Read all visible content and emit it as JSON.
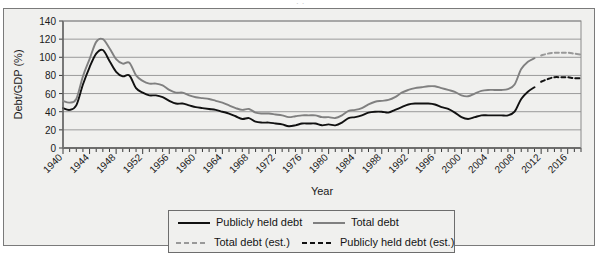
{
  "figure": {
    "clipped_caption": "· ·",
    "background_color": "#f0f0ee",
    "frame_color": "#7a7a7a"
  },
  "chart_data": {
    "type": "line",
    "title": "",
    "xlabel": "Year",
    "ylabel": "Debt/GDP (%)",
    "xlim": [
      1940,
      2018
    ],
    "ylim": [
      0,
      140
    ],
    "yticks": [
      0,
      20,
      40,
      60,
      80,
      100,
      120,
      140
    ],
    "ytick_labels": [
      "0",
      "20",
      "40",
      "60",
      "80",
      "100",
      "120",
      "140"
    ],
    "xticks_major": [
      1940,
      1944,
      1948,
      1952,
      1956,
      1960,
      1964,
      1968,
      1972,
      1976,
      1980,
      1984,
      1988,
      1992,
      1996,
      2000,
      2004,
      2008,
      2012,
      2016
    ],
    "xtick_labels": [
      "1940",
      "1944",
      "1948",
      "1952",
      "1956",
      "1960",
      "1964",
      "1968",
      "1972",
      "1976",
      "1980",
      "1984",
      "1988",
      "1992",
      "1996",
      "2000",
      "2004",
      "2008",
      "2012",
      "2016"
    ],
    "xtick_minor_interval": 1,
    "grid": "horizontal",
    "legend_position": "below-axes",
    "colors": {
      "publicly_held_debt": "#111111",
      "total_debt": "#808080",
      "total_debt_est": "#999999",
      "publicly_held_debt_est": "#111111",
      "gridline": "#9a9a9a"
    },
    "series": [
      {
        "name": "Publicly held debt",
        "style": "solid",
        "color": "#111111",
        "x": [
          1940,
          1941,
          1942,
          1943,
          1944,
          1945,
          1946,
          1947,
          1948,
          1949,
          1950,
          1951,
          1952,
          1953,
          1954,
          1955,
          1956,
          1957,
          1958,
          1959,
          1960,
          1961,
          1962,
          1963,
          1964,
          1965,
          1966,
          1967,
          1968,
          1969,
          1970,
          1971,
          1972,
          1973,
          1974,
          1975,
          1976,
          1977,
          1978,
          1979,
          1980,
          1981,
          1982,
          1983,
          1984,
          1985,
          1986,
          1987,
          1988,
          1989,
          1990,
          1991,
          1992,
          1993,
          1994,
          1995,
          1996,
          1997,
          1998,
          1999,
          2000,
          2001,
          2002,
          2003,
          2004,
          2005,
          2006,
          2007,
          2008,
          2009,
          2010,
          2011
        ],
        "y": [
          44,
          42,
          47,
          70,
          89,
          104,
          108,
          96,
          84,
          79,
          80,
          66,
          61,
          58,
          58,
          56,
          52,
          49,
          49,
          47,
          45,
          44,
          43,
          42,
          40,
          38,
          35,
          32,
          33,
          29,
          28,
          28,
          27,
          26,
          24,
          25,
          27,
          27,
          27,
          25,
          26,
          25,
          28,
          33,
          34,
          36,
          39,
          40,
          40,
          39,
          42,
          45,
          48,
          49,
          49,
          49,
          48,
          45,
          43,
          39,
          34,
          32,
          34,
          36,
          36,
          36,
          36,
          36,
          40,
          54,
          62,
          67
        ]
      },
      {
        "name": "Total debt",
        "style": "solid",
        "color": "#808080",
        "x": [
          1940,
          1941,
          1942,
          1943,
          1944,
          1945,
          1946,
          1947,
          1948,
          1949,
          1950,
          1951,
          1952,
          1953,
          1954,
          1955,
          1956,
          1957,
          1958,
          1959,
          1960,
          1961,
          1962,
          1963,
          1964,
          1965,
          1966,
          1967,
          1968,
          1969,
          1970,
          1971,
          1972,
          1973,
          1974,
          1975,
          1976,
          1977,
          1978,
          1979,
          1980,
          1981,
          1982,
          1983,
          1984,
          1985,
          1986,
          1987,
          1988,
          1989,
          1990,
          1991,
          1992,
          1993,
          1994,
          1995,
          1996,
          1997,
          1998,
          1999,
          2000,
          2001,
          2002,
          2003,
          2004,
          2005,
          2006,
          2007,
          2008,
          2009,
          2010,
          2011
        ],
        "y": [
          52,
          50,
          54,
          79,
          98,
          117,
          120,
          110,
          98,
          93,
          94,
          80,
          74,
          71,
          71,
          69,
          64,
          61,
          61,
          58,
          56,
          55,
          54,
          52,
          50,
          47,
          44,
          42,
          43,
          39,
          38,
          38,
          37,
          36,
          34,
          35,
          36,
          36,
          36,
          34,
          34,
          33,
          36,
          41,
          42,
          44,
          48,
          51,
          52,
          53,
          56,
          61,
          64,
          66,
          67,
          68,
          68,
          66,
          64,
          62,
          58,
          57,
          60,
          63,
          64,
          64,
          64,
          65,
          70,
          87,
          95,
          99
        ]
      },
      {
        "name": "Total debt (est.)",
        "style": "dashed",
        "color": "#999999",
        "x": [
          2012,
          2013,
          2014,
          2015,
          2016,
          2017,
          2018
        ],
        "y": [
          102,
          104,
          105,
          105,
          105,
          104,
          103
        ]
      },
      {
        "name": "Publicly held debt (est.)",
        "style": "dashed",
        "color": "#111111",
        "x": [
          2012,
          2013,
          2014,
          2015,
          2016,
          2017,
          2018
        ],
        "y": [
          73,
          76,
          78,
          78,
          78,
          77,
          77
        ]
      }
    ]
  },
  "legend": {
    "entries": [
      {
        "label": "Publicly held debt",
        "style": "solid",
        "color": "#111111"
      },
      {
        "label": "Total debt",
        "style": "solid",
        "color": "#808080"
      },
      {
        "label": "Total debt (est.)",
        "style": "dashed",
        "color": "#999999"
      },
      {
        "label": "Publicly held debt (est.)",
        "style": "dashed",
        "color": "#111111"
      }
    ]
  }
}
